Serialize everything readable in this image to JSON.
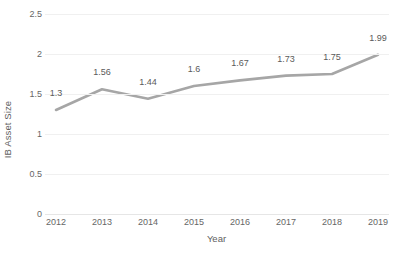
{
  "chart_data": {
    "type": "line",
    "title": "",
    "xlabel": "Year",
    "ylabel": "IB Asset Size",
    "categories": [
      "2012",
      "2013",
      "2014",
      "2015",
      "2016",
      "2017",
      "2018",
      "2019"
    ],
    "values": [
      1.3,
      1.56,
      1.44,
      1.6,
      1.67,
      1.73,
      1.75,
      1.99
    ],
    "data_labels": [
      "1.3",
      "1.56",
      "1.44",
      "1.6",
      "1.67",
      "1.73",
      "1.75",
      "1.99"
    ],
    "series": [
      {
        "name": "IB Asset Size",
        "values": [
          1.3,
          1.56,
          1.44,
          1.6,
          1.67,
          1.73,
          1.75,
          1.99
        ],
        "color": "#a6a6a6"
      }
    ],
    "ylim": [
      0,
      2.5
    ],
    "ytick_labels": [
      "0",
      "0.5",
      "1",
      "1.5",
      "2",
      "2.5"
    ],
    "ytick_values": [
      0,
      0.5,
      1,
      1.5,
      2,
      2.5
    ],
    "grid": true,
    "grid_color": "#f0f0f0",
    "axis_color": "#e6e6e6",
    "legend": "none",
    "background": "#ffffff",
    "show_markers": false,
    "show_data_labels": true
  }
}
